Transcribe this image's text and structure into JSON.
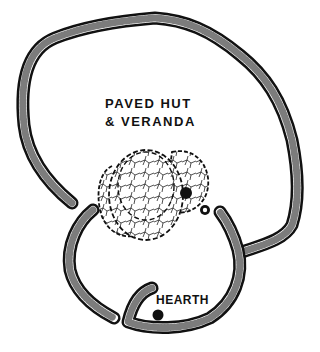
{
  "diagram": {
    "type": "archaeological site plan",
    "labels": {
      "hut_line1": "PAVED HUT",
      "hut_line2": "& VERANDA",
      "hearth": "HEARTH"
    },
    "elements": [
      {
        "name": "outer-enclosure-wall",
        "style": "stippled stone wall"
      },
      {
        "name": "inner-enclosure-wall",
        "style": "stippled stone wall"
      },
      {
        "name": "paved-hut",
        "style": "dashed outline, cracked paving"
      },
      {
        "name": "veranda",
        "style": "dashed outline, cracked paving"
      },
      {
        "name": "post-hole",
        "style": "black dot"
      },
      {
        "name": "small-stone",
        "style": "small stippled circle"
      },
      {
        "name": "hearth-marker",
        "style": "black dot"
      }
    ],
    "colors": {
      "ink": "#111111",
      "background": "#ffffff"
    }
  }
}
